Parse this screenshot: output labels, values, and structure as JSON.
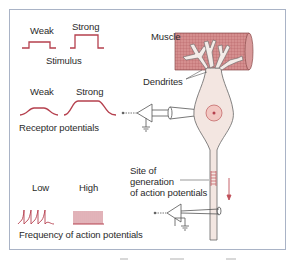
{
  "figure": {
    "stimulus": {
      "weak_label": "Weak",
      "strong_label": "Strong",
      "title": "Stimulus"
    },
    "receptor": {
      "weak_label": "Weak",
      "strong_label": "Strong",
      "title": "Receptor potentials"
    },
    "action_potentials": {
      "low_label": "Low",
      "high_label": "High",
      "title": "Frequency of action potentials"
    },
    "muscle_label": "Muscle",
    "dendrites_label": "Dendrites",
    "site_label_line1": "Site of",
    "site_label_line2": "generation",
    "site_label_line3": "of action potentials",
    "colors": {
      "trace": "#b5404e",
      "muscle": "#d48a8a",
      "cell": "#f3e6e1",
      "frame": "#a9b3c6",
      "outline": "#555555"
    }
  }
}
